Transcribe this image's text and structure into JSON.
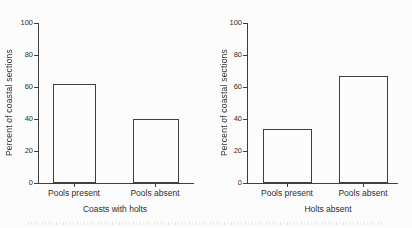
{
  "figure": {
    "background": "#fcfcfc",
    "line_color": "#3f3f3f",
    "text_color": "#2e2e2e",
    "caption_note": ""
  },
  "chart_data": [
    {
      "type": "bar",
      "title": "",
      "xlabel": "Coasts with holts",
      "ylabel": "Percent of coastal sections",
      "categories": [
        "Pools present",
        "Pools absent"
      ],
      "values": [
        62,
        40
      ],
      "ylim": [
        0,
        100
      ],
      "y_ticks": [
        0,
        20,
        40,
        60,
        80,
        100
      ],
      "grid": false,
      "legend": "none",
      "bar_fill": "#fcfcfc",
      "bar_outline": "#3f3f3f"
    },
    {
      "type": "bar",
      "title": "",
      "xlabel": "Holts absent",
      "ylabel": "Percent of coastal sections",
      "categories": [
        "Pools present",
        "Pools absent"
      ],
      "values": [
        34,
        67
      ],
      "ylim": [
        0,
        100
      ],
      "y_ticks": [
        0,
        20,
        40,
        60,
        80,
        100
      ],
      "grid": false,
      "legend": "none",
      "bar_fill": "#fcfcfc",
      "bar_outline": "#3f3f3f"
    }
  ]
}
